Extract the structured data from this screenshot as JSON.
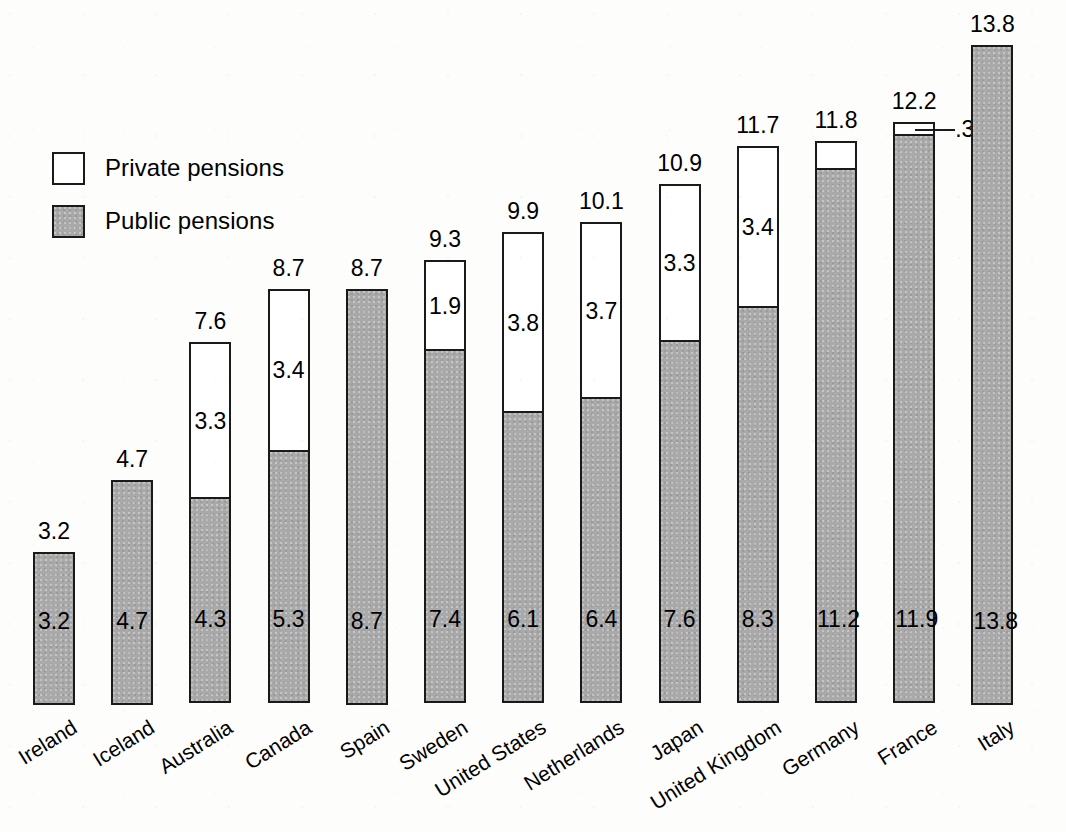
{
  "legend": {
    "position": "top-left",
    "items": [
      {
        "key": "private",
        "label": "Private pensions",
        "swatch": "white-outline"
      },
      {
        "key": "public",
        "label": "Public pensions",
        "swatch": "gray-fill"
      }
    ]
  },
  "colors": {
    "public_fill": "#a9a9a9",
    "private_fill": "#ffffff",
    "outline": "#1a1a1a",
    "background": "#ffffff",
    "text": "#000000"
  },
  "chart_data": {
    "type": "bar",
    "subtype": "stacked-vertical",
    "title": "",
    "subtitle": "",
    "xlabel": "",
    "ylabel": "",
    "ylim": [
      0,
      13.8
    ],
    "grid": false,
    "axis_visible": false,
    "legend_position": "top-left",
    "stacked": true,
    "categories": [
      "Ireland",
      "Iceland",
      "Australia",
      "Canada",
      "Spain",
      "Sweden",
      "United States",
      "Netherlands",
      "Japan",
      "United Kingdom",
      "Germany",
      "France",
      "Italy"
    ],
    "series": [
      {
        "name": "Public pensions",
        "values": [
          3.2,
          4.7,
          4.3,
          5.3,
          8.7,
          7.4,
          6.1,
          6.4,
          7.6,
          8.3,
          11.2,
          11.9,
          13.8
        ],
        "labels": [
          "3.2",
          "4.7",
          "4.3",
          "5.3",
          "8.7",
          "7.4",
          "6.1",
          "6.4",
          "7.6",
          "8.3",
          "11.2",
          "11.9",
          "13.8"
        ]
      },
      {
        "name": "Private pensions",
        "values": [
          0,
          0,
          3.3,
          3.4,
          0,
          1.9,
          3.8,
          3.7,
          3.3,
          3.4,
          0.6,
          0.3,
          0
        ],
        "labels": [
          "",
          "",
          "3.3",
          "3.4",
          "",
          "1.9",
          "3.8",
          "3.7",
          "3.3",
          "3.4",
          ".6",
          ".3",
          ""
        ]
      }
    ],
    "totals": [
      3.2,
      4.7,
      7.6,
      8.7,
      8.7,
      9.3,
      9.9,
      10.1,
      10.9,
      11.7,
      11.8,
      12.2,
      13.8
    ],
    "total_labels": [
      "3.2",
      "4.7",
      "7.6",
      "8.7",
      "8.7",
      "9.3",
      "9.9",
      "10.1",
      "10.9",
      "11.7",
      "11.8",
      "12.2",
      "13.8"
    ],
    "annotations": [
      {
        "category": "France",
        "series": "Private pensions",
        "text": ".3",
        "style": "leader-line-right"
      }
    ]
  }
}
